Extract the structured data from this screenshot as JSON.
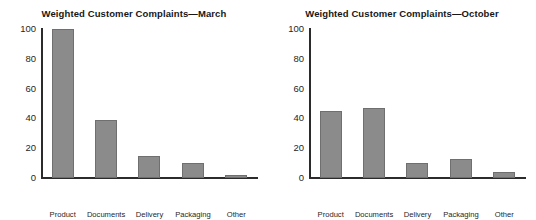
{
  "figure": {
    "background": "#ffffff",
    "bar_fill": "#8b8b8b",
    "bar_stroke": "#6f6f6f",
    "axis_color": "#2b2b2b"
  },
  "chart_data": [
    {
      "type": "bar",
      "title": "Weighted Customer Complaints—March",
      "xlabel": "",
      "ylabel": "",
      "categories": [
        "Product quality",
        "Documents",
        "Delivery",
        "Packaging",
        "Other"
      ],
      "category_lines": [
        [
          "Product",
          "quality"
        ],
        [
          "Documents"
        ],
        [
          "Delivery"
        ],
        [
          "Packaging"
        ],
        [
          "Other"
        ]
      ],
      "values": [
        100,
        39,
        15,
        10,
        2
      ],
      "ylim": [
        0,
        100
      ],
      "yticks": [
        100,
        80,
        60,
        40,
        20,
        0
      ],
      "grid": false,
      "legend": "none"
    },
    {
      "type": "bar",
      "title": "Weighted Customer Complaints—October",
      "xlabel": "",
      "ylabel": "",
      "categories": [
        "Product quality",
        "Documents",
        "Delivery",
        "Packaging",
        "Other"
      ],
      "category_lines": [
        [
          "Product",
          "quality"
        ],
        [
          "Documents"
        ],
        [
          "Delivery"
        ],
        [
          "Packaging"
        ],
        [
          "Other"
        ]
      ],
      "values": [
        45,
        47,
        10,
        13,
        4
      ],
      "ylim": [
        0,
        100
      ],
      "yticks": [
        100,
        80,
        60,
        40,
        20,
        0
      ],
      "grid": false,
      "legend": "none"
    }
  ]
}
